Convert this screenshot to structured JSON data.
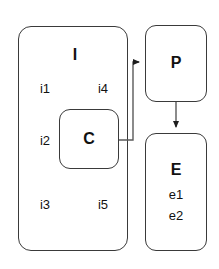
{
  "diagram": {
    "type": "block-diagram",
    "background_color": "#ffffff",
    "stroke_color": "#3a3a3a",
    "text_color": "#111111",
    "nodes": [
      {
        "id": "I",
        "title": "I",
        "shape": "rounded-rectangle",
        "members": [
          "i1",
          "i4",
          "i2",
          "i3",
          "i5"
        ]
      },
      {
        "id": "C",
        "title": "C",
        "shape": "rounded-rectangle",
        "members": [],
        "nested_in": "I"
      },
      {
        "id": "P",
        "title": "P",
        "shape": "rounded-rectangle",
        "members": []
      },
      {
        "id": "E",
        "title": "E",
        "shape": "rounded-rectangle",
        "members": [
          "e1",
          "e2"
        ]
      }
    ],
    "edges": [
      {
        "from": "C",
        "to": "P",
        "style": "orthogonal",
        "arrowhead": "filled-triangle"
      },
      {
        "from": "P",
        "to": "E",
        "style": "straight",
        "arrowhead": "filled-triangle"
      }
    ]
  },
  "labels": {
    "i_title": "I",
    "i1": "i1",
    "i2": "i2",
    "i3": "i3",
    "i4": "i4",
    "i5": "i5",
    "c_title": "C",
    "p_title": "P",
    "e_title": "E",
    "e1": "e1",
    "e2": "e2"
  }
}
